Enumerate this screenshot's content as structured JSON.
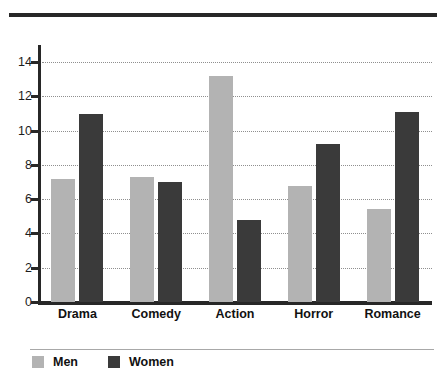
{
  "chart_data": {
    "type": "bar",
    "title": "",
    "subtitle": "",
    "xlabel": "",
    "ylabel": "",
    "categories": [
      "Drama",
      "Comedy",
      "Action",
      "Horror",
      "Romance"
    ],
    "series": [
      {
        "name": "Men",
        "color": "#b3b3b3",
        "values": [
          7.2,
          7.3,
          13.2,
          6.8,
          5.4
        ]
      },
      {
        "name": "Women",
        "color": "#3a3a3a",
        "values": [
          11.0,
          7.0,
          4.8,
          9.2,
          11.1
        ]
      }
    ],
    "ylim": [
      0,
      15
    ],
    "yticks": [
      0,
      2,
      4,
      6,
      8,
      10,
      12,
      14
    ],
    "ytick_labels": [
      "0",
      "2",
      "4",
      "6",
      "8",
      "10",
      "12",
      "14"
    ],
    "grid": "horizontal-dotted",
    "legend_position": "bottom-left"
  },
  "axis": {
    "ticks": [
      {
        "label": "14",
        "value": 14
      },
      {
        "label": "12",
        "value": 12
      },
      {
        "label": "10",
        "value": 10
      },
      {
        "label": "8",
        "value": 8
      },
      {
        "label": "6",
        "value": 6
      },
      {
        "label": "4",
        "value": 4
      },
      {
        "label": "2",
        "value": 2
      },
      {
        "label": "0",
        "value": 0
      }
    ]
  },
  "legend": {
    "items": [
      {
        "label": "Men",
        "color": "#b3b3b3"
      },
      {
        "label": "Women",
        "color": "#3a3a3a"
      }
    ]
  },
  "colors": {
    "men": "#b3b3b3",
    "women": "#3a3a3a",
    "axis": "#272727",
    "grid": "#8f8f8f",
    "background": "#ffffff"
  }
}
